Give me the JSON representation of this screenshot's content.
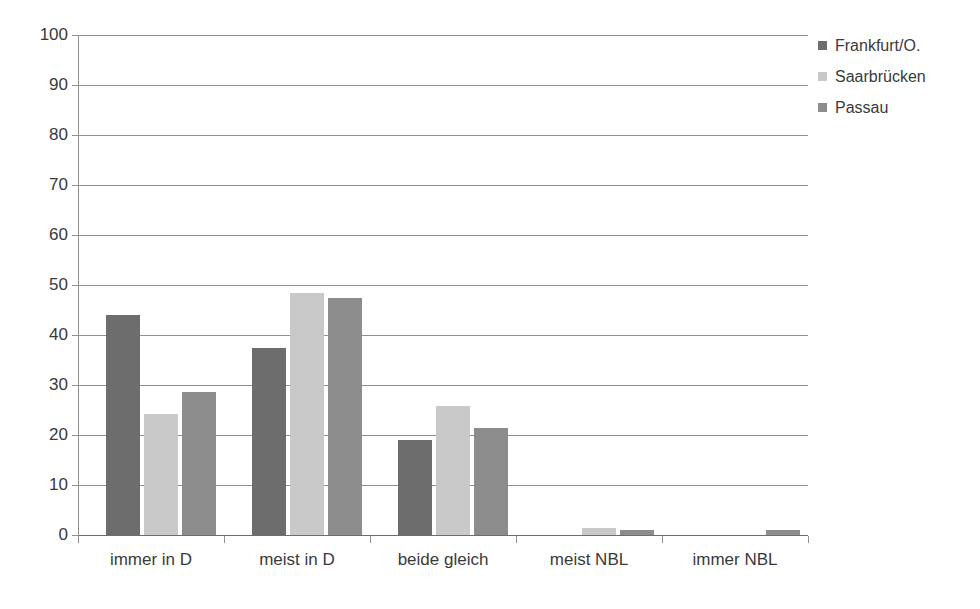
{
  "scan_remnant_text": "",
  "chart_data": {
    "type": "bar",
    "title": "",
    "subtitle": "",
    "xlabel": "",
    "ylabel": "",
    "ylim": [
      0,
      100
    ],
    "ytick_step": 10,
    "yticks": [
      0,
      10,
      20,
      30,
      40,
      50,
      60,
      70,
      80,
      90,
      100
    ],
    "ytick_labels": [
      "0",
      "10",
      "20",
      "30",
      "40",
      "50",
      "60",
      "70",
      "80",
      "90",
      "100"
    ],
    "grid": true,
    "grid_axis": "y",
    "legend_position": "right-top",
    "categories": [
      "immer in D",
      "meist in D",
      "beide gleich",
      "meist NBL",
      "immer NBL"
    ],
    "series": [
      {
        "name": "Frankfurt/O.",
        "color": "#6d6d6d",
        "values": [
          44.0,
          37.4,
          19.0,
          0.0,
          0.0
        ]
      },
      {
        "name": "Saarbrücken",
        "color": "#c9c9c9",
        "values": [
          24.2,
          48.5,
          25.8,
          1.4,
          0.0
        ]
      },
      {
        "name": "Passau",
        "color": "#8c8c8c",
        "values": [
          28.6,
          47.5,
          21.5,
          1.1,
          1.1
        ]
      }
    ]
  },
  "axis_colors": {
    "gridline": "#8f8f8f",
    "axis_line": "#8f8f8f",
    "tick_label": "#3a3a3a"
  }
}
